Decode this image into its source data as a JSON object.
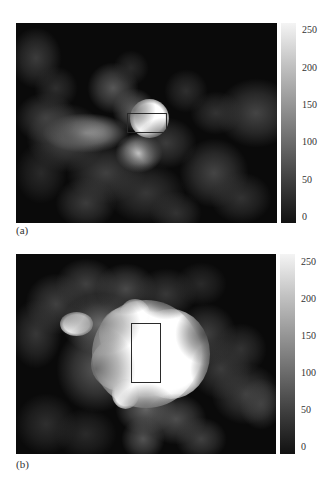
{
  "chart_data": [
    {
      "type": "heatmap",
      "label": "(a)",
      "title": "",
      "xlabel": "",
      "ylabel": "",
      "colormap": "gray",
      "colorbar": {
        "min": 0,
        "max": 255,
        "ticks": [
          0,
          50,
          100,
          150,
          200,
          250
        ]
      },
      "grid": false,
      "roi_rectangle": {
        "x": 111,
        "y": 90,
        "width": 40,
        "height": 20
      },
      "panel_size": {
        "width": 261,
        "height": 200
      },
      "blobs": [
        {
          "x": 133,
          "y": 95,
          "rx": 13,
          "ry": 13,
          "v": 255
        },
        {
          "x": 70,
          "y": 110,
          "rx": 20,
          "ry": 9,
          "v": 200
        },
        {
          "x": 123,
          "y": 130,
          "rx": 11,
          "ry": 9,
          "v": 215
        },
        {
          "x": 118,
          "y": 87,
          "rx": 10,
          "ry": 10,
          "v": 110
        },
        {
          "x": 97,
          "y": 65,
          "rx": 12,
          "ry": 12,
          "v": 95
        },
        {
          "x": 50,
          "y": 115,
          "rx": 18,
          "ry": 16,
          "v": 85
        },
        {
          "x": 30,
          "y": 95,
          "rx": 14,
          "ry": 12,
          "v": 70
        },
        {
          "x": 20,
          "y": 35,
          "rx": 12,
          "ry": 14,
          "v": 65
        },
        {
          "x": 40,
          "y": 65,
          "rx": 10,
          "ry": 10,
          "v": 50
        },
        {
          "x": 90,
          "y": 150,
          "rx": 18,
          "ry": 14,
          "v": 70
        },
        {
          "x": 70,
          "y": 180,
          "rx": 14,
          "ry": 12,
          "v": 65
        },
        {
          "x": 130,
          "y": 170,
          "rx": 18,
          "ry": 14,
          "v": 60
        },
        {
          "x": 150,
          "y": 120,
          "rx": 14,
          "ry": 12,
          "v": 65
        },
        {
          "x": 198,
          "y": 150,
          "rx": 16,
          "ry": 16,
          "v": 75
        },
        {
          "x": 240,
          "y": 90,
          "rx": 18,
          "ry": 16,
          "v": 75
        },
        {
          "x": 200,
          "y": 90,
          "rx": 12,
          "ry": 10,
          "v": 55
        },
        {
          "x": 170,
          "y": 68,
          "rx": 10,
          "ry": 10,
          "v": 50
        },
        {
          "x": 225,
          "y": 175,
          "rx": 14,
          "ry": 12,
          "v": 55
        },
        {
          "x": 115,
          "y": 45,
          "rx": 8,
          "ry": 8,
          "v": 45
        },
        {
          "x": 160,
          "y": 190,
          "rx": 12,
          "ry": 10,
          "v": 55
        },
        {
          "x": 25,
          "y": 150,
          "rx": 12,
          "ry": 14,
          "v": 45
        }
      ]
    },
    {
      "type": "heatmap",
      "label": "(b)",
      "title": "",
      "xlabel": "",
      "ylabel": "",
      "colormap": "gray",
      "colorbar": {
        "min": 0,
        "max": 255,
        "ticks": [
          0,
          50,
          100,
          150,
          200,
          250
        ]
      },
      "grid": false,
      "roi_rectangle": {
        "x": 115,
        "y": 69,
        "width": 30,
        "height": 60
      },
      "panel_size": {
        "width": 260,
        "height": 200
      },
      "blobs": [
        {
          "x": 130,
          "y": 100,
          "rx": 36,
          "ry": 36,
          "v": 255
        },
        {
          "x": 155,
          "y": 100,
          "rx": 26,
          "ry": 30,
          "v": 255
        },
        {
          "x": 105,
          "y": 110,
          "rx": 20,
          "ry": 18,
          "v": 255
        },
        {
          "x": 110,
          "y": 80,
          "rx": 18,
          "ry": 18,
          "v": 255
        },
        {
          "x": 119,
          "y": 60,
          "rx": 10,
          "ry": 10,
          "v": 250
        },
        {
          "x": 60,
          "y": 70,
          "rx": 11,
          "ry": 8,
          "v": 245
        },
        {
          "x": 109,
          "y": 140,
          "rx": 9,
          "ry": 10,
          "v": 245
        },
        {
          "x": 85,
          "y": 70,
          "rx": 18,
          "ry": 14,
          "v": 120
        },
        {
          "x": 80,
          "y": 115,
          "rx": 18,
          "ry": 20,
          "v": 95
        },
        {
          "x": 40,
          "y": 50,
          "rx": 14,
          "ry": 14,
          "v": 70
        },
        {
          "x": 20,
          "y": 80,
          "rx": 12,
          "ry": 16,
          "v": 60
        },
        {
          "x": 70,
          "y": 30,
          "rx": 14,
          "ry": 12,
          "v": 70
        },
        {
          "x": 110,
          "y": 35,
          "rx": 14,
          "ry": 12,
          "v": 80
        },
        {
          "x": 150,
          "y": 40,
          "rx": 14,
          "ry": 12,
          "v": 60
        },
        {
          "x": 130,
          "y": 155,
          "rx": 14,
          "ry": 12,
          "v": 110
        },
        {
          "x": 160,
          "y": 165,
          "rx": 14,
          "ry": 12,
          "v": 85
        },
        {
          "x": 127,
          "y": 185,
          "rx": 10,
          "ry": 10,
          "v": 90
        },
        {
          "x": 185,
          "y": 185,
          "rx": 12,
          "ry": 10,
          "v": 70
        },
        {
          "x": 230,
          "y": 140,
          "rx": 16,
          "ry": 14,
          "v": 70
        },
        {
          "x": 245,
          "y": 150,
          "rx": 10,
          "ry": 12,
          "v": 70
        },
        {
          "x": 205,
          "y": 115,
          "rx": 14,
          "ry": 14,
          "v": 65
        },
        {
          "x": 190,
          "y": 80,
          "rx": 14,
          "ry": 14,
          "v": 70
        },
        {
          "x": 225,
          "y": 95,
          "rx": 12,
          "ry": 12,
          "v": 55
        },
        {
          "x": 30,
          "y": 170,
          "rx": 14,
          "ry": 14,
          "v": 50
        },
        {
          "x": 70,
          "y": 180,
          "rx": 14,
          "ry": 12,
          "v": 45
        },
        {
          "x": 185,
          "y": 30,
          "rx": 12,
          "ry": 10,
          "v": 45
        }
      ]
    }
  ]
}
